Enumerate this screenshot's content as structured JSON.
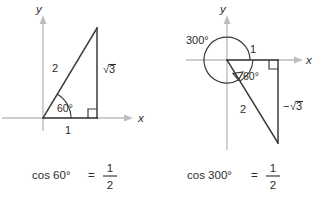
{
  "figure": {
    "background_color": "#ffffff",
    "line_color": "#3a3a3a",
    "axis_color": "#bdbdbd",
    "text_color": "#2b2b2b"
  },
  "panels": [
    {
      "id": "left",
      "name": "cos-60-diagram",
      "axis": {
        "x_label": "x",
        "y_label": "y"
      },
      "angle_label": "60°",
      "labels": {
        "hypotenuse": "2",
        "vertical": "√3",
        "horizontal": "1"
      },
      "right_angle_marker": true,
      "caption": {
        "expression": "cos 60°",
        "equals": "=",
        "numerator": "1",
        "denominator": "2",
        "full_text": "cos 60° = 1/2"
      }
    },
    {
      "id": "right",
      "name": "cos-300-diagram",
      "axis": {
        "x_label": "x",
        "y_label": "y"
      },
      "rotation_label": "300°",
      "angle_label": "60°",
      "labels": {
        "hypotenuse": "2",
        "vertical": "−√3",
        "horizontal": "1"
      },
      "right_angle_marker": true,
      "caption": {
        "expression": "cos 300°",
        "equals": "=",
        "numerator": "1",
        "denominator": "2",
        "full_text": "cos 300° = 1/2"
      }
    }
  ]
}
